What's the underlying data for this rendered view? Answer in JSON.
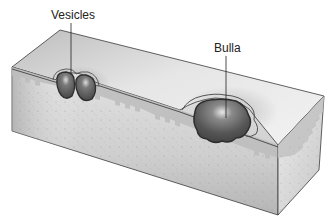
{
  "diagram": {
    "labels": {
      "vesicles": "Vesicles",
      "bulla": "Bulla"
    },
    "colors": {
      "background": "#ffffff",
      "surface": "#d9d9d9",
      "surface_light": "#ececec",
      "dermis": "#d4d4d4",
      "dermis_dark": "#a8a8a8",
      "epidermis_band": "#b8b8b8",
      "blister_fill": "#5a5a5a",
      "blister_outline": "#2e2e2e",
      "label_text": "#222222",
      "leader_line": "#222222"
    }
  }
}
